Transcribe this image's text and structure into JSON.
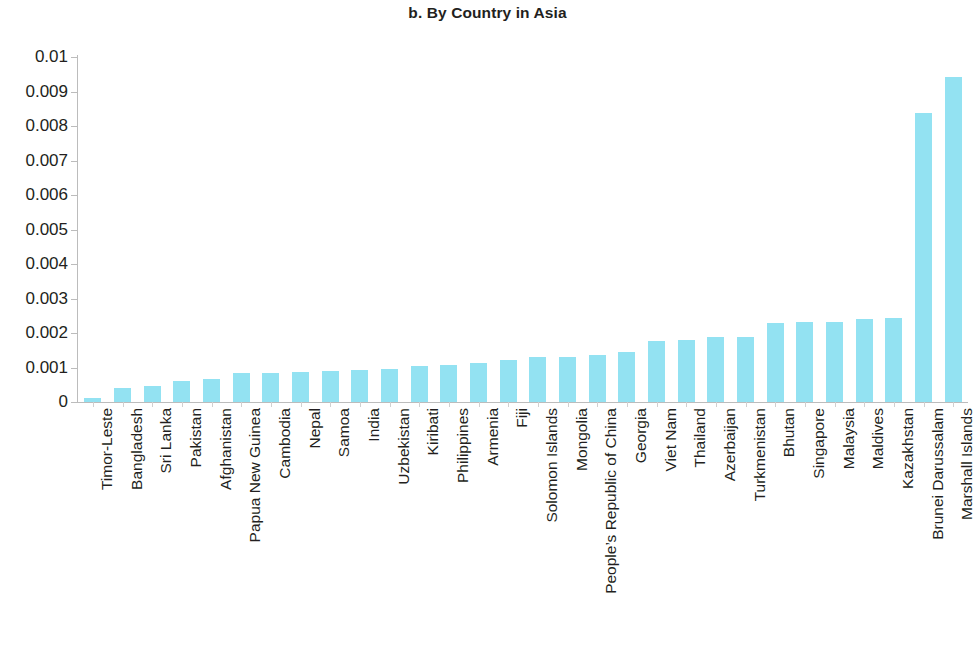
{
  "chart_data": {
    "type": "bar",
    "title": "b. By Country in Asia",
    "xlabel": "",
    "ylabel": "",
    "ylim": [
      0,
      0.01
    ],
    "grid": false,
    "legend": null,
    "bar_color": "#93e2f2",
    "axis_color": "#bcbcbc",
    "text_color": "#231f20",
    "ytick_labels": [
      "0.01",
      "0.009",
      "0.008",
      "0.007",
      "0.006",
      "0.005",
      "0.004",
      "0.003",
      "0.002",
      "0.001",
      "0"
    ],
    "ytick_values": [
      0.01,
      0.009,
      0.008,
      0.007,
      0.006,
      0.005,
      0.004,
      0.003,
      0.002,
      0.001,
      0
    ],
    "categories": [
      "Timor-Leste",
      "Bangladesh",
      "Sri Lanka",
      "Pakistan",
      "Afghanistan",
      "Papua New Guinea",
      "Cambodia",
      "Nepal",
      "Samoa",
      "India",
      "Uzbekistan",
      "Kiribati",
      "Philippines",
      "Armenia",
      "Fiji",
      "Solomon Islands",
      "Mongolia",
      "People’s Republic of China",
      "Georgia",
      "Viet Nam",
      "Thailand",
      "Azerbaijan",
      "Turkmenistan",
      "Bhutan",
      "Singapore",
      "Malaysia",
      "Maldives",
      "Kazakhstan",
      "Brunei Darussalam",
      "Marshall Islands"
    ],
    "values": [
      0.00012,
      0.00042,
      0.00045,
      0.0006,
      0.00066,
      0.00083,
      0.00085,
      0.00087,
      0.00091,
      0.00094,
      0.00097,
      0.00104,
      0.00107,
      0.00114,
      0.00121,
      0.0013,
      0.00131,
      0.00137,
      0.00144,
      0.00178,
      0.0018,
      0.00188,
      0.00188,
      0.0023,
      0.00231,
      0.00232,
      0.0024,
      0.00243,
      0.00838,
      0.00943
    ]
  }
}
